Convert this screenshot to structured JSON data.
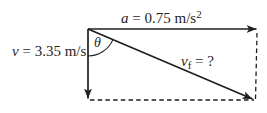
{
  "diagram": {
    "colors": {
      "background": "#ffffff",
      "line": "#1f1f1f"
    },
    "labels": {
      "acceleration": {
        "variable": "a",
        "rest": " = 0.75 m/s",
        "superscript": "2"
      },
      "initial_velocity": {
        "variable": "v",
        "rest": " = 3.35 m/s"
      },
      "final_velocity": {
        "variable": "v",
        "subscript": "f",
        "rest": " = ?"
      },
      "angle": {
        "symbol": "θ"
      }
    }
  }
}
